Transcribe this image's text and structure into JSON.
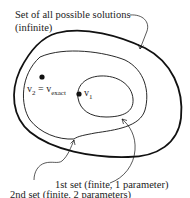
{
  "diagram": {
    "colors": {
      "stroke": "#111111",
      "text": "#222222",
      "background": "#ffffff"
    },
    "sets": [
      {
        "id": "all",
        "label_line1": "Set of all possible solutions",
        "label_line2": "(infinite)"
      },
      {
        "id": "second",
        "label": "2nd set (finite, 2 parameters)"
      },
      {
        "id": "first",
        "label": "1st set (finite, 1 parameter)"
      }
    ],
    "points": [
      {
        "id": "v2",
        "base": "v",
        "sub": "2",
        "eq": " = ",
        "rhs_base": "v",
        "rhs_sub": "exact"
      },
      {
        "id": "v1",
        "base": "v",
        "sub": "1"
      }
    ]
  }
}
